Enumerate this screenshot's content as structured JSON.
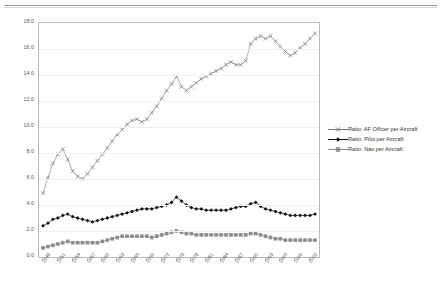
{
  "chart_data": {
    "type": "line",
    "title": "",
    "xlabel": "",
    "ylabel": "",
    "ylim": [
      0.0,
      18.0
    ],
    "yticks": [
      "0.0",
      "2.0",
      "4.0",
      "6.0",
      "8.0",
      "10.0",
      "12.0",
      "14.0",
      "16.0",
      "18.0"
    ],
    "grid": true,
    "legend_position": "right",
    "x": [
      1948,
      1949,
      1950,
      1951,
      1952,
      1953,
      1954,
      1955,
      1956,
      1957,
      1958,
      1959,
      1960,
      1961,
      1962,
      1963,
      1964,
      1965,
      1966,
      1967,
      1968,
      1969,
      1970,
      1971,
      1972,
      1973,
      1974,
      1975,
      1976,
      1977,
      1978,
      1979,
      1980,
      1981,
      1982,
      1983,
      1984,
      1985,
      1986,
      1987,
      1988,
      1989,
      1990,
      1991,
      1992,
      1993,
      1994,
      1995,
      1996,
      1997,
      1998,
      1999,
      2000,
      2001,
      2002,
      2003
    ],
    "xtick_labels": [
      "1948",
      "1951",
      "1954",
      "1957",
      "1960",
      "1963",
      "1966",
      "1969",
      "1972",
      "1975",
      "1978",
      "1981",
      "1984",
      "1987",
      "1990",
      "1993",
      "1996",
      "1999",
      "2002"
    ],
    "series": [
      {
        "name": "Ratio:  AF Officer per Aircraft",
        "marker": "cross",
        "color": "#777777",
        "values": [
          4.9,
          6.1,
          7.2,
          7.9,
          8.3,
          7.5,
          6.6,
          6.2,
          6.0,
          6.4,
          6.9,
          7.4,
          7.9,
          8.4,
          8.9,
          9.4,
          9.8,
          10.2,
          10.5,
          10.6,
          10.4,
          10.6,
          11.1,
          11.6,
          12.2,
          12.8,
          13.3,
          13.9,
          13.1,
          12.8,
          13.1,
          13.4,
          13.7,
          13.9,
          14.1,
          14.3,
          14.5,
          14.8,
          15.0,
          14.8,
          14.8,
          15.1,
          16.4,
          16.8,
          17.0,
          16.8,
          17.0,
          16.6,
          16.2,
          15.8,
          15.5,
          15.7,
          16.1,
          16.4,
          16.8,
          17.2
        ]
      },
      {
        "name": "Ratio: Pilot per Aircraft",
        "marker": "diamond",
        "color": "#111111",
        "values": [
          2.4,
          2.6,
          2.9,
          3.0,
          3.2,
          3.3,
          3.1,
          3.0,
          2.9,
          2.8,
          2.7,
          2.8,
          2.9,
          3.0,
          3.1,
          3.2,
          3.3,
          3.4,
          3.5,
          3.6,
          3.7,
          3.7,
          3.7,
          3.8,
          3.9,
          4.0,
          4.2,
          4.6,
          4.3,
          4.0,
          3.8,
          3.7,
          3.7,
          3.6,
          3.6,
          3.6,
          3.6,
          3.6,
          3.7,
          3.8,
          3.9,
          3.9,
          4.1,
          4.2,
          3.9,
          3.7,
          3.6,
          3.5,
          3.4,
          3.3,
          3.2,
          3.2,
          3.2,
          3.2,
          3.2,
          3.3
        ]
      },
      {
        "name": "Ratio: Nav per Aircraft",
        "marker": "square",
        "color": "#8d8d8d",
        "values": [
          0.7,
          0.8,
          0.9,
          1.0,
          1.1,
          1.2,
          1.1,
          1.1,
          1.1,
          1.1,
          1.1,
          1.1,
          1.2,
          1.3,
          1.4,
          1.5,
          1.6,
          1.6,
          1.6,
          1.6,
          1.6,
          1.6,
          1.5,
          1.6,
          1.7,
          1.8,
          1.9,
          2.0,
          1.9,
          1.8,
          1.8,
          1.7,
          1.7,
          1.7,
          1.7,
          1.7,
          1.7,
          1.7,
          1.7,
          1.7,
          1.7,
          1.7,
          1.8,
          1.8,
          1.7,
          1.6,
          1.5,
          1.4,
          1.4,
          1.3,
          1.3,
          1.3,
          1.3,
          1.3,
          1.3,
          1.3
        ]
      }
    ]
  },
  "legend": {
    "items": [
      {
        "label": "Ratio:  AF Officer per Aircraft"
      },
      {
        "label": "Ratio: Pilot per Aircraft"
      },
      {
        "label": "Ratio: Nav per Aircraft"
      }
    ]
  }
}
